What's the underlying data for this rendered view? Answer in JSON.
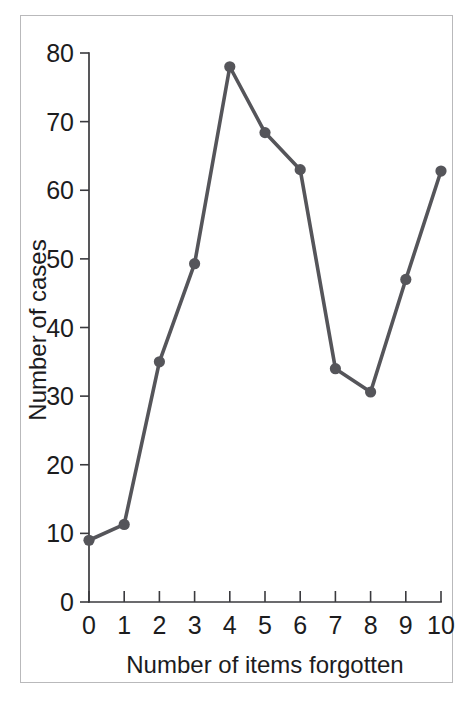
{
  "chart_data": {
    "type": "line",
    "title": "",
    "subtitle": "",
    "xlabel": "Number of items forgotten",
    "ylabel": "Number of cases",
    "x": [
      0,
      1,
      2,
      3,
      4,
      5,
      6,
      7,
      8,
      9,
      10
    ],
    "values": [
      9,
      11.3,
      35,
      49.3,
      78,
      68.4,
      63,
      34,
      30.6,
      47,
      62.8
    ],
    "series": [
      {
        "name": "Number of cases",
        "values": [
          9,
          11.3,
          35,
          49.3,
          78,
          68.4,
          63,
          34,
          30.6,
          47,
          62.8
        ]
      }
    ],
    "xlim": [
      0,
      10
    ],
    "ylim": [
      0,
      80
    ],
    "xticks": [
      0,
      1,
      2,
      3,
      4,
      5,
      6,
      7,
      8,
      9,
      10
    ],
    "yticks": [
      0,
      10,
      20,
      30,
      40,
      50,
      60,
      70,
      80
    ],
    "xtick_labels": [
      "0",
      "1",
      "2",
      "3",
      "4",
      "5",
      "6",
      "7",
      "8",
      "9",
      "10"
    ],
    "ytick_labels": [
      "0",
      "10",
      "20",
      "30",
      "40",
      "50",
      "60",
      "70",
      "80"
    ],
    "grid": false,
    "legend": false,
    "legend_position": "none",
    "marker": "circle",
    "annotations": [],
    "colors": {
      "line": "#55555a",
      "marker": "#55555a",
      "axis": "#3a3a3e",
      "text": "#1c1c1e",
      "frame": "#b9b9bb",
      "background": "#ffffff"
    }
  }
}
